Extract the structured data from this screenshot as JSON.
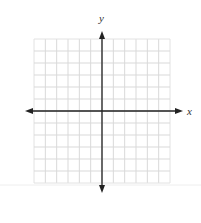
{
  "diagram": {
    "type": "coordinate-plane",
    "x_axis_label": "x",
    "y_axis_label": "y",
    "grid": {
      "columns": 12,
      "rows": 12,
      "left": 34,
      "top": 39,
      "width": 136,
      "height": 144,
      "line_color": "#d9d9d9",
      "border_color": "#e2e2e2"
    },
    "axes": {
      "color": "#222222",
      "x_axis_y": 111,
      "y_axis_x": 102,
      "x_arrow_left": 25,
      "x_arrow_right": 183,
      "y_arrow_top": 31,
      "y_arrow_bottom": 193
    },
    "separator": {
      "y": 185,
      "color": "#eeeeee"
    }
  }
}
